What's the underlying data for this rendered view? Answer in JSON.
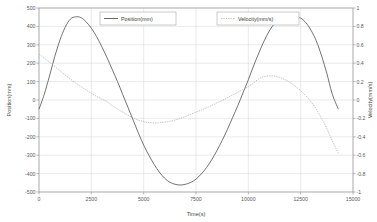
{
  "chart_data": {
    "type": "line",
    "title": "",
    "xlabel": "Time(s)",
    "ylabel": "Position(mm)",
    "ylabel_right": "Velocity(mm/s)",
    "xlim": [
      0,
      15000
    ],
    "ylim": [
      -500,
      500
    ],
    "ylim_right": [
      -1,
      1
    ],
    "grid": true,
    "legend_position": "top-center",
    "x_ticks": [
      "0",
      "2500",
      "5000",
      "7500",
      "10000",
      "12500",
      "15000"
    ],
    "x_tick_values": [
      0,
      2500,
      5000,
      7500,
      10000,
      12500,
      15000
    ],
    "y_ticks_left": [
      "500",
      "400",
      "300",
      "200",
      "100",
      "0",
      "-100",
      "-200",
      "-300",
      "-400",
      "-500"
    ],
    "y_tick_values_left": [
      500,
      400,
      300,
      200,
      100,
      0,
      -100,
      -200,
      -300,
      -400,
      -500
    ],
    "y_ticks_right": [
      "1",
      "0.8",
      "0.6",
      "0.4",
      "0.2",
      "0",
      "-0.2",
      "-0.4",
      "-0.6",
      "-0.8",
      "-1"
    ],
    "y_tick_values_right": [
      1,
      0.8,
      0.6,
      0.4,
      0.2,
      0,
      -0.2,
      -0.4,
      -0.6,
      -0.8,
      -1
    ],
    "series": [
      {
        "name": "Position(mm)",
        "axis": "left",
        "style": "solid",
        "color": "#555a5e",
        "x": [
          0,
          250,
          500,
          750,
          1000,
          1250,
          1500,
          1750,
          2000,
          2250,
          2500,
          2750,
          3000,
          3250,
          3500,
          3750,
          4000,
          4250,
          4500,
          4750,
          5000,
          5250,
          5500,
          5750,
          6000,
          6250,
          6500,
          6750,
          7000,
          7250,
          7500,
          7750,
          8000,
          8250,
          8500,
          8750,
          9000,
          9250,
          9500,
          9750,
          10000,
          10250,
          10500,
          10750,
          11000,
          11250,
          11500,
          11750,
          12000,
          12250,
          12500,
          12750,
          13000,
          13250,
          13500,
          13750,
          14000,
          14300
        ],
        "y": [
          -50,
          30,
          130,
          235,
          325,
          395,
          440,
          452,
          448,
          425,
          390,
          345,
          290,
          230,
          165,
          100,
          30,
          -40,
          -110,
          -180,
          -245,
          -300,
          -350,
          -392,
          -425,
          -447,
          -458,
          -462,
          -458,
          -448,
          -430,
          -402,
          -368,
          -325,
          -275,
          -220,
          -160,
          -95,
          -30,
          40,
          110,
          185,
          255,
          320,
          375,
          415,
          440,
          452,
          453,
          448,
          445,
          420,
          378,
          320,
          240,
          145,
          35,
          -50
        ]
      },
      {
        "name": "Velocity(mm/s)",
        "axis": "right",
        "style": "dashed",
        "color": "#9fa3a7",
        "x": [
          0,
          250,
          500,
          750,
          1000,
          1250,
          1500,
          1750,
          2000,
          2250,
          2500,
          2750,
          3000,
          3250,
          3500,
          3750,
          4000,
          4250,
          4500,
          4750,
          5000,
          5250,
          5500,
          5750,
          6000,
          6250,
          6500,
          6750,
          7000,
          7250,
          7500,
          7750,
          8000,
          8250,
          8500,
          8750,
          9000,
          9250,
          9500,
          9750,
          10000,
          10250,
          10500,
          10750,
          11000,
          11250,
          11500,
          11750,
          12000,
          12250,
          12500,
          12750,
          13000,
          13250,
          13500,
          13750,
          14000,
          14300
        ],
        "y": [
          0.5,
          0.455,
          0.41,
          0.365,
          0.318,
          0.272,
          0.228,
          0.185,
          0.145,
          0.108,
          0.072,
          0.04,
          0.01,
          -0.018,
          -0.062,
          -0.098,
          -0.132,
          -0.165,
          -0.196,
          -0.218,
          -0.235,
          -0.245,
          -0.25,
          -0.248,
          -0.242,
          -0.232,
          -0.218,
          -0.2,
          -0.178,
          -0.155,
          -0.132,
          -0.11,
          -0.085,
          -0.06,
          -0.032,
          -0.005,
          0.025,
          0.055,
          0.085,
          0.115,
          0.145,
          0.185,
          0.23,
          0.255,
          0.262,
          0.258,
          0.245,
          0.222,
          0.19,
          0.148,
          0.1,
          0.045,
          -0.02,
          -0.1,
          -0.2,
          -0.31,
          -0.44,
          -0.58
        ]
      }
    ],
    "legend": [
      {
        "label": "Position(mm)",
        "style": "solid",
        "color": "#555a5e"
      },
      {
        "label": "Velocity(mm/s)",
        "style": "dashed",
        "color": "#9fa3a7"
      }
    ],
    "colors": {
      "background": "#ffffff",
      "grid": "#dcdcdc",
      "axis": "#9a9a9a",
      "position_series": "#555a5e",
      "velocity_series": "#9fa3a7",
      "tick_text": "#5a5a5a"
    }
  }
}
